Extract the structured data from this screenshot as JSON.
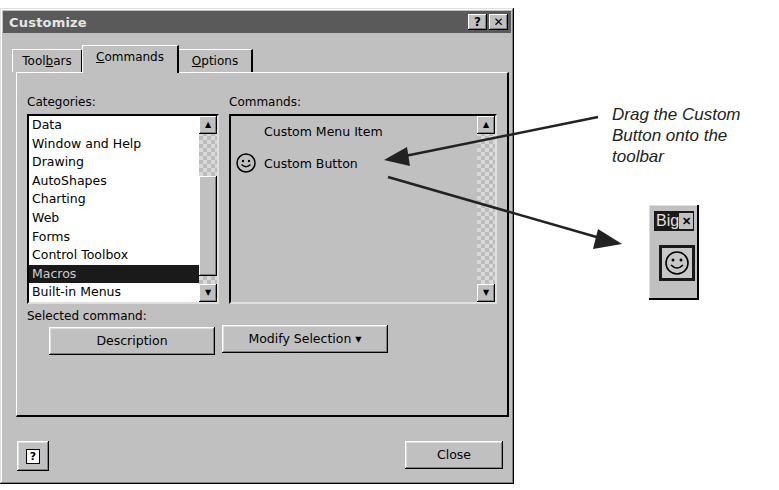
{
  "dialog": {
    "title": "Customize",
    "help_button": "?",
    "close_x": "✕",
    "tabs": [
      {
        "label_pre": "Tool",
        "label_u": "b",
        "label_post": "ars",
        "active": false
      },
      {
        "label_pre": "",
        "label_u": "C",
        "label_post": "ommands",
        "active": true
      },
      {
        "label_pre": "",
        "label_u": "O",
        "label_post": "ptions",
        "active": false
      }
    ],
    "categories": {
      "label": "Categories:",
      "items": [
        "Data",
        "Window and Help",
        "Drawing",
        "AutoShapes",
        "Charting",
        "Web",
        "Forms",
        "Control Toolbox",
        "Macros",
        "Built-in Menus"
      ],
      "selected": "Macros"
    },
    "commands": {
      "label": "Commands:",
      "items": [
        {
          "label": "Custom Menu Item",
          "icon": ""
        },
        {
          "label": "Custom Button",
          "icon": "smiley-icon"
        }
      ]
    },
    "selected_command_label": "Selected command:",
    "description_button": "Description",
    "modify_selection_button": "Modify Selection ▾",
    "close_button": "Close",
    "help_icon_glyph": "?"
  },
  "annotation": {
    "text": "Drag the Custom Button onto the toolbar"
  },
  "floating_toolbar": {
    "title": "Big",
    "close": "✕",
    "button_icon": "smiley-icon"
  }
}
